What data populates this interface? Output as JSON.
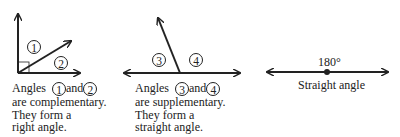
{
  "panels": [
    {
      "id": "complementary",
      "angle_labels": [
        "1",
        "2"
      ],
      "caption": {
        "line1_prefix": "Angles",
        "line1_mid": "and",
        "line2": "are complementary.",
        "line3": "They form a",
        "line4": "right angle."
      }
    },
    {
      "id": "supplementary",
      "angle_labels": [
        "3",
        "4"
      ],
      "caption": {
        "line1_prefix": "Angles",
        "line1_mid": "and",
        "line2": "are supplementary.",
        "line3": "They form a",
        "line4": "straight angle."
      }
    },
    {
      "id": "straight",
      "degree_label": "180°",
      "caption": "Straight angle"
    }
  ],
  "colors": {
    "stroke": "#222222",
    "background": "#ffffff"
  }
}
